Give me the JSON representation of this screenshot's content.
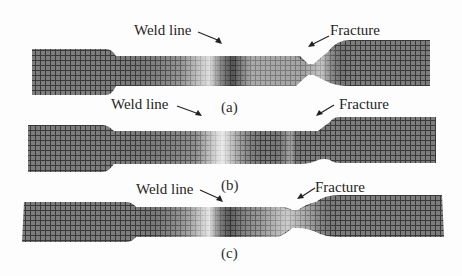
{
  "figure": {
    "panels": [
      {
        "id": "a",
        "caption": "(a)",
        "weld_label": "Weld line",
        "fracture_label": "Fracture",
        "description": "Tensile specimen with grid pattern; fracture in gauge section right of weld line"
      },
      {
        "id": "b",
        "caption": "(b)",
        "weld_label": "Weld line",
        "fracture_label": "Fracture",
        "description": "Tensile specimen with grid pattern; weld zone at center, fracture near right shoulder"
      },
      {
        "id": "c",
        "caption": "(c)",
        "weld_label": "Weld line",
        "fracture_label": "Fracture",
        "description": "Tensile specimen with grid pattern; necked fracture region right of weld line"
      }
    ],
    "colors": {
      "background": "#fdfdfd",
      "specimen_dark": "#6a6a6a",
      "specimen_mid": "#9a9a9a",
      "grid_line": "#3c3c3c",
      "weld_light": "#e6e6e6",
      "text": "#262626"
    }
  }
}
